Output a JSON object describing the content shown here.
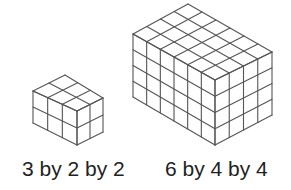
{
  "figure": {
    "line_color": "#555555",
    "background": "#ffffff",
    "prisms": [
      {
        "name": "small-prism",
        "label": "3 by 2 by 2",
        "dims": {
          "left": 3,
          "right": 2,
          "height": 2
        },
        "corners": {
          "back_top": [
            65,
            75
          ],
          "left_top": [
            33,
            91
          ],
          "front_top": [
            77,
            111
          ],
          "right_top": [
            103,
            98
          ],
          "left_bottom": [
            33,
            123
          ],
          "front_bottom": [
            77,
            145
          ],
          "right_bottom": [
            103,
            132
          ]
        }
      },
      {
        "name": "large-prism",
        "label": "6 by 4 by 4",
        "dims": {
          "left": 6,
          "right": 4,
          "height": 4
        },
        "corners": {
          "back_top": [
            188,
            4
          ],
          "left_top": [
            133,
            34
          ],
          "front_top": [
            215,
            80
          ],
          "right_top": [
            272,
            52
          ],
          "left_bottom": [
            133,
            97
          ],
          "front_bottom": [
            215,
            145
          ],
          "right_bottom": [
            272,
            115
          ]
        }
      }
    ]
  }
}
